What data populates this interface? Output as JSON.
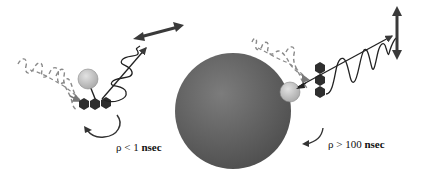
{
  "diagram": {
    "type": "fluorescence-polarization-schematic",
    "panels": [
      {
        "id": "free-tracer",
        "description": "Small free fluorescent tracer rotates fast; emitted light depolarized",
        "label": {
          "symbol": "ρ",
          "relation": "<",
          "value": "1",
          "unit": "nsec"
        },
        "excitation": "dashed-wave",
        "emission": "helical-wave",
        "polarization_arrow": "diagonal-double-arrow",
        "rotation": "fast"
      },
      {
        "id": "bound-tracer",
        "description": "Tracer bound to large molecule rotates slowly; emitted light remains polarized",
        "label": {
          "symbol": "ρ",
          "relation": ">",
          "value": "100",
          "unit": "nsec"
        },
        "excitation": "dashed-wave",
        "emission": "planar-sine-wave",
        "polarization_arrow": "vertical-double-arrow",
        "rotation": "slow"
      }
    ],
    "colors": {
      "large_sphere": "#6a6a6a",
      "small_sphere": "#c8c8c8",
      "fluorophore": "#2e2e2e",
      "arrows": "#3a3a3a",
      "dashed_wave": "#8a8a8a",
      "text": "#111111"
    }
  }
}
